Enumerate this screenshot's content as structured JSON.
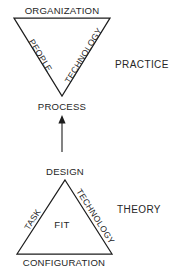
{
  "diagram": {
    "stroke_color": "#1d1d1d",
    "text_color": "#262626",
    "background_color": "#ffffff",
    "practice": {
      "section_label": "PRACTICE",
      "shape": "inverted-triangle",
      "top_label": "ORGANIZATION",
      "left_edge_label": "PEOPLE",
      "right_edge_label": "TECHNOLOGY",
      "apex_label": "PROCESS"
    },
    "theory": {
      "section_label": "THEORY",
      "shape": "triangle",
      "apex_label": "DESIGN",
      "left_edge_label": "TASK",
      "right_edge_label": "TECHNOLOGY",
      "base_label": "CONFIGURATION",
      "center_label": "FIT"
    },
    "connector": {
      "name": "upward-arrow",
      "from": "DESIGN",
      "to": "PROCESS",
      "direction": "up"
    }
  }
}
